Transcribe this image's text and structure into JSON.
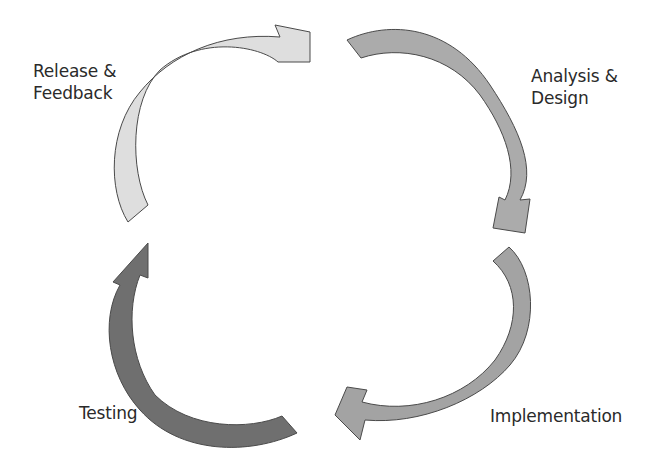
{
  "diagram": {
    "type": "cycle",
    "title": "",
    "stages": [
      {
        "id": "release",
        "label": "Release &\nFeedback",
        "color": "#dedede",
        "position": "top-left"
      },
      {
        "id": "analysis",
        "label": "Analysis &\nDesign",
        "color": "#ababab",
        "position": "top-right"
      },
      {
        "id": "implementation",
        "label": "Implementation",
        "color": "#a3a3a3",
        "position": "bottom-right"
      },
      {
        "id": "testing",
        "label": "Testing",
        "color": "#6f6f6f",
        "position": "bottom-left"
      }
    ],
    "flow": [
      "Release & Feedback",
      "Analysis & Design",
      "Implementation",
      "Testing",
      "Release & Feedback"
    ],
    "direction": "clockwise"
  }
}
